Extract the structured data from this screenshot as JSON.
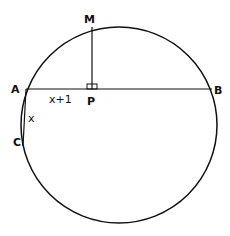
{
  "diagram": {
    "points": {
      "A": "A",
      "B": "B",
      "C": "C",
      "M": "M",
      "P": "P"
    },
    "segment_labels": {
      "AP": "x+1",
      "AC": "x"
    },
    "right_angle_at": "P",
    "stroke_color": "#111111",
    "background": "#ffffff"
  }
}
